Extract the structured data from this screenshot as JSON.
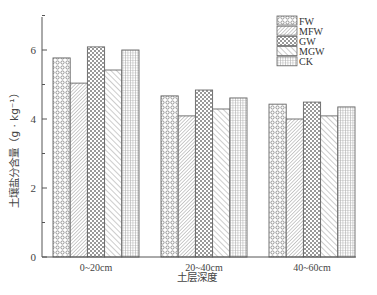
{
  "chart_data": {
    "type": "bar",
    "title": "",
    "xlabel": "土层深度",
    "ylabel": "土壤盐分含量（g · kg⁻¹）",
    "categories": [
      "0~20cm",
      "20~40cm",
      "40~60cm"
    ],
    "series": [
      {
        "name": "FW",
        "pattern": "circles",
        "values": [
          5.77,
          4.67,
          4.43
        ]
      },
      {
        "name": "MFW",
        "pattern": "fine-diag",
        "values": [
          5.04,
          4.09,
          4.0
        ]
      },
      {
        "name": "GW",
        "pattern": "checker",
        "values": [
          6.09,
          4.84,
          4.49
        ]
      },
      {
        "name": "MGW",
        "pattern": "diag",
        "values": [
          5.42,
          4.29,
          4.09
        ]
      },
      {
        "name": "CK",
        "pattern": "grid",
        "values": [
          6.0,
          4.61,
          4.35
        ]
      }
    ],
    "ylim": [
      0,
      7
    ],
    "yticks": [
      0,
      2,
      4,
      6
    ],
    "grid": false,
    "legend_position": "top-right"
  },
  "colors": {
    "axis": "#555555",
    "bar_stroke": "#666666",
    "pattern": "#8a8a8a"
  }
}
